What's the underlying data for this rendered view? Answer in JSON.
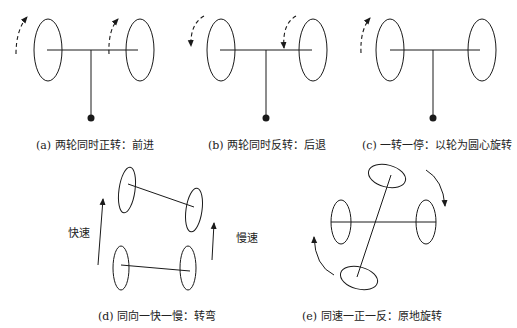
{
  "captions": {
    "a": "(a) 两轮同时正转：前进",
    "b": "(b) 两轮同时反转：后退",
    "c": "(c) 一转一停：以轮为圆心旋转",
    "d": "(d) 同向一快一慢：转弯",
    "e": "(e) 同速一正一反：原地旋转"
  },
  "labels": {
    "fast": "快速",
    "slow": "慢速"
  },
  "colors": {
    "line": "#1a1a1a",
    "background": "#ffffff"
  }
}
